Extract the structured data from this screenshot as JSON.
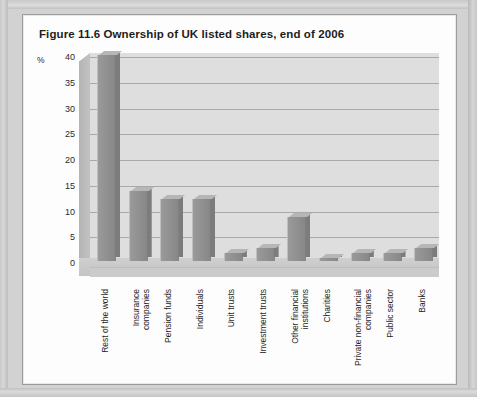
{
  "page": {
    "figure_title": "Figure 11.6  Ownership of UK listed shares, end of 2006"
  },
  "axis": {
    "unit_label": "%",
    "y_ticks": [
      "40",
      "35",
      "30",
      "25",
      "20",
      "15",
      "10",
      "5",
      "0"
    ]
  },
  "chart_data": {
    "type": "bar",
    "title": "Figure 11.6  Ownership of UK listed shares, end of 2006",
    "xlabel": "",
    "ylabel": "%",
    "ylim": [
      0,
      40
    ],
    "grid": true,
    "legend": "none",
    "three_d": true,
    "categories": [
      "Rest of the world",
      "Insurance companies",
      "Pension funds",
      "Individuals",
      "Unit trusts",
      "Investment trusts",
      "Other financial institutions",
      "Charities",
      "Private non-financial companies",
      "Public sector",
      "Banks"
    ],
    "category_lines": [
      [
        "Rest of the world"
      ],
      [
        "Insurance",
        "companies"
      ],
      [
        "Pension funds"
      ],
      [
        "Individuals"
      ],
      [
        "Unit trusts"
      ],
      [
        "Investment trusts"
      ],
      [
        "Other financial",
        "institutions"
      ],
      [
        "Charities"
      ],
      [
        "Private non-financial",
        "companies"
      ],
      [
        "Public sector"
      ],
      [
        "Banks"
      ]
    ],
    "values": [
      40.0,
      13.5,
      12.0,
      12.0,
      1.5,
      2.5,
      8.5,
      0.5,
      1.5,
      1.5,
      2.5
    ]
  },
  "colors": {
    "bar_face": "#8e8e8e",
    "bar_top": "#b6b6b6",
    "bar_side": "#7c7c7c",
    "plot_background": "#dedede",
    "gridline": "#a9a9a9",
    "page": "#fdfdfd",
    "scan_background": "#d2d2d2"
  }
}
